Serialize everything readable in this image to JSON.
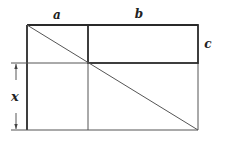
{
  "diagram": {
    "labels": {
      "a": "a",
      "b": "b",
      "c": "c",
      "x": "x"
    },
    "colors": {
      "stroke": "#2a2a2a",
      "thin_stroke": "#555555",
      "background": "#ffffff"
    }
  }
}
